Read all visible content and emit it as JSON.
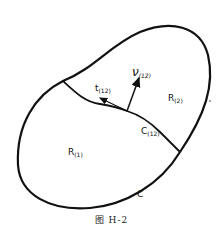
{
  "figure": {
    "caption": "图  H-2",
    "regions": {
      "r1": {
        "main": "R",
        "sub": "(1)"
      },
      "r2": {
        "main": "R",
        "sub": "(2)"
      }
    },
    "curves": {
      "outer": {
        "main": "C",
        "sub": ""
      },
      "interface": {
        "main": "C",
        "sub": "(12)"
      }
    },
    "vectors": {
      "normal": {
        "main": "ν",
        "sub": "(12)"
      },
      "tangent": {
        "main": "t",
        "sub": "(12)"
      }
    },
    "colors": {
      "stroke": "#111111",
      "background": "#ffffff"
    }
  }
}
